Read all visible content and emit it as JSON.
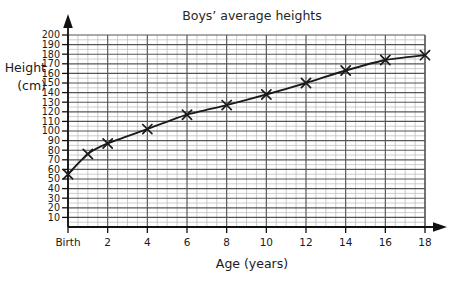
{
  "chart_data": {
    "type": "line",
    "title": "Boys’ average heights",
    "xlabel": "Age (years)",
    "ylabel": "Height\n(cm)",
    "ylabel_line1": "Height",
    "ylabel_line2": "(cm)",
    "grid": true,
    "legend": false,
    "legend_position": "none",
    "marker": "x",
    "xlim": [
      0,
      18
    ],
    "ylim": [
      0,
      200
    ],
    "x_tick_labels": [
      "Birth",
      "2",
      "4",
      "6",
      "8",
      "10",
      "12",
      "14",
      "16",
      "18"
    ],
    "x_tick_values": [
      0,
      2,
      4,
      6,
      8,
      10,
      12,
      14,
      16,
      18
    ],
    "x_major_step": 2,
    "x_minor_step": 0.5,
    "y_tick_labels": [
      "10",
      "20",
      "30",
      "40",
      "50",
      "60",
      "70",
      "80",
      "90",
      "100",
      "110",
      "120",
      "130",
      "140",
      "150",
      "160",
      "170",
      "180",
      "190",
      "200"
    ],
    "y_tick_values": [
      10,
      20,
      30,
      40,
      50,
      60,
      70,
      80,
      90,
      100,
      110,
      120,
      130,
      140,
      150,
      160,
      170,
      180,
      190,
      200
    ],
    "y_major_step": 10,
    "y_minor_step": 5,
    "x": [
      0,
      1,
      2,
      4,
      6,
      8,
      10,
      12,
      14,
      16,
      18
    ],
    "values": [
      55,
      76,
      87,
      102,
      117,
      127,
      138,
      150,
      163,
      174,
      179
    ],
    "series": [
      {
        "name": "Boys’ average height",
        "x": [
          0,
          1,
          2,
          4,
          6,
          8,
          10,
          12,
          14,
          16,
          18
        ],
        "values": [
          55,
          76,
          87,
          102,
          117,
          127,
          138,
          150,
          163,
          174,
          179
        ]
      }
    ],
    "colors": {
      "curve": "#1a1a1a",
      "marker": "#1a1a1a",
      "grid_major": "#555555",
      "grid_minor": "#b8b8b8",
      "axis": "#111111",
      "background": "#ffffff"
    }
  }
}
